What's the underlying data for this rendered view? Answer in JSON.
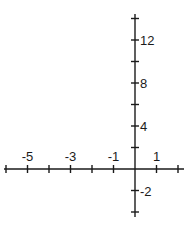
{
  "chart_data": {
    "type": "axes",
    "title": "",
    "xlabel": "",
    "ylabel": "",
    "x_axis": {
      "range": [
        -6,
        2
      ],
      "tick_step": 1,
      "ticks": [
        -6,
        -5,
        -4,
        -3,
        -2,
        -1,
        0,
        1,
        2
      ],
      "labels": [
        {
          "value": -5,
          "text": "-5"
        },
        {
          "value": -3,
          "text": "-3"
        },
        {
          "value": -1,
          "text": "-1"
        },
        {
          "value": 1,
          "text": "1"
        }
      ],
      "label_position": "above"
    },
    "y_axis": {
      "range": [
        -4,
        14
      ],
      "tick_step": 2,
      "ticks": [
        -4,
        -2,
        2,
        4,
        6,
        8,
        10,
        12,
        14
      ],
      "labels": [
        {
          "value": 12,
          "text": "12"
        },
        {
          "value": 8,
          "text": "8"
        },
        {
          "value": 4,
          "text": "4"
        },
        {
          "value": -2,
          "text": "-2"
        }
      ],
      "label_position": "right"
    },
    "grid": false,
    "series": []
  },
  "style": {
    "axis_color": "#1a1a1a",
    "background": "#ffffff"
  }
}
